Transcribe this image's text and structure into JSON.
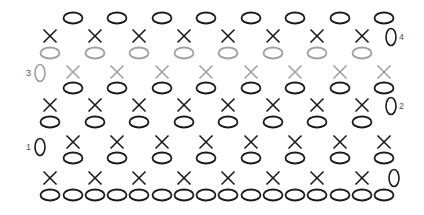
{
  "diagram": {
    "title": "",
    "type": "crochet-stitch-chart",
    "colors": {
      "primary_stitch": "#1a1a1a",
      "highlight_row_stitch": "#a0a0a0",
      "label": "#555555",
      "background": "#ffffff"
    },
    "legend_symbols": {
      "oval": "chain stitch",
      "x": "single crochet"
    },
    "rows": [
      {
        "label": "4",
        "label_side": "right",
        "color": "primary",
        "chain_y": 18,
        "chain_x": [
          73,
          117,
          162,
          206,
          251,
          295,
          340,
          384
        ],
        "stitch_y": 36,
        "stitch_x": [
          50,
          95,
          139,
          184,
          228,
          273,
          317,
          362
        ],
        "turning_chain": {
          "x": 391,
          "y": 37
        }
      },
      {
        "label": "3",
        "label_side": "left",
        "color": "highlight",
        "chain_y": 53,
        "chain_x": [
          50,
          95,
          139,
          184,
          228,
          273,
          317,
          362
        ],
        "stitch_y": 72,
        "stitch_x": [
          73,
          117,
          162,
          206,
          251,
          295,
          340,
          384
        ],
        "turning_chain": {
          "x": 40,
          "y": 73
        }
      },
      {
        "label": "2",
        "label_side": "right",
        "color": "primary",
        "chain_y": 88,
        "chain_x": [
          73,
          117,
          162,
          206,
          251,
          295,
          340,
          384
        ],
        "stitch_y": 105,
        "stitch_x": [
          50,
          95,
          139,
          184,
          228,
          273,
          317,
          362
        ],
        "turning_chain": {
          "x": 391,
          "y": 106
        }
      },
      {
        "label": "1",
        "label_side": "left",
        "color": "primary",
        "chain_y": 122,
        "chain_x": [
          50,
          95,
          139,
          184,
          228,
          273,
          317,
          362
        ],
        "stitch_y": 142,
        "stitch_x": [
          73,
          117,
          162,
          206,
          251,
          295,
          340,
          384
        ],
        "turning_chain": {
          "x": 40,
          "y": 147
        }
      },
      {
        "label": "",
        "label_side": "right",
        "color": "primary",
        "chain_y": 158,
        "chain_x": [
          73,
          117,
          162,
          206,
          251,
          295,
          340,
          384
        ],
        "stitch_y": 178,
        "stitch_x": [
          50,
          95,
          139,
          184,
          228,
          273,
          317,
          362
        ],
        "turning_chain": {
          "x": 394,
          "y": 178
        }
      }
    ],
    "foundation_chain": {
      "y": 195,
      "x": [
        50,
        73,
        95,
        117,
        139,
        162,
        184,
        206,
        228,
        251,
        273,
        295,
        317,
        340,
        362,
        384
      ]
    },
    "row_labels": [
      "1",
      "2",
      "3",
      "4"
    ]
  }
}
